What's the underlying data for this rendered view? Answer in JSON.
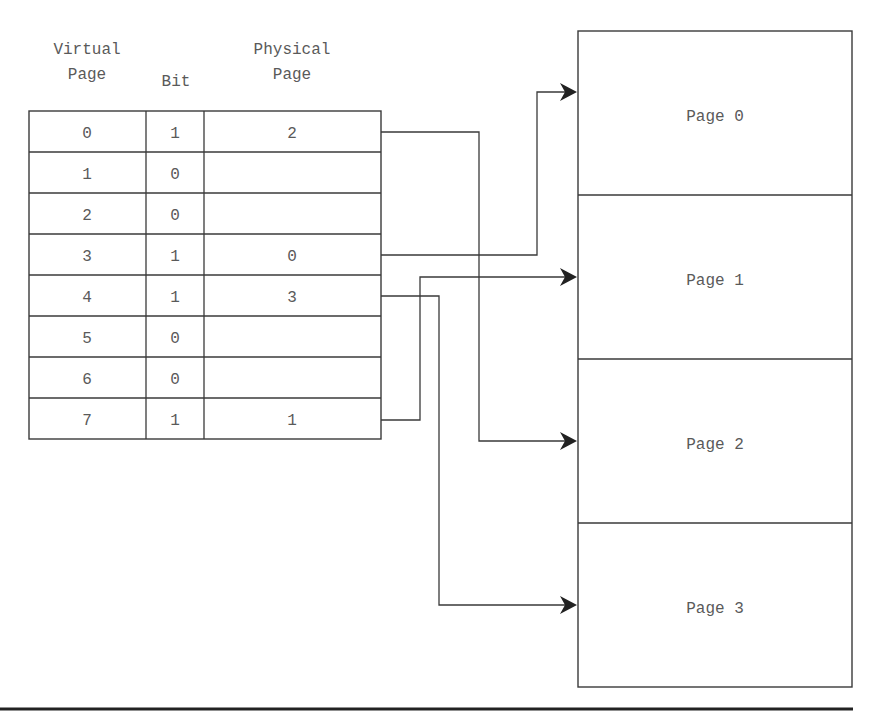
{
  "headers": {
    "virtual_line1": "Virtual",
    "virtual_line2": "Page",
    "bit": "Bit",
    "physical_line1": "Physical",
    "physical_line2": "Page"
  },
  "page_table": [
    {
      "virtual": "0",
      "bit": "1",
      "physical": "2"
    },
    {
      "virtual": "1",
      "bit": "0",
      "physical": ""
    },
    {
      "virtual": "2",
      "bit": "0",
      "physical": ""
    },
    {
      "virtual": "3",
      "bit": "1",
      "physical": "0"
    },
    {
      "virtual": "4",
      "bit": "1",
      "physical": "3"
    },
    {
      "virtual": "5",
      "bit": "0",
      "physical": ""
    },
    {
      "virtual": "6",
      "bit": "0",
      "physical": ""
    },
    {
      "virtual": "7",
      "bit": "1",
      "physical": "1"
    }
  ],
  "physical_memory": [
    {
      "label": "Page 0"
    },
    {
      "label": "Page 1"
    },
    {
      "label": "Page 2"
    },
    {
      "label": "Page 3"
    }
  ],
  "mappings": [
    {
      "from_virtual": "0",
      "to_physical": "Page 2"
    },
    {
      "from_virtual": "3",
      "to_physical": "Page 0"
    },
    {
      "from_virtual": "4",
      "to_physical": "Page 3"
    },
    {
      "from_virtual": "7",
      "to_physical": "Page 1"
    }
  ]
}
